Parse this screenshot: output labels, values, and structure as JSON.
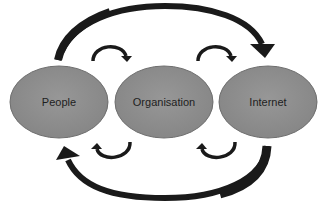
{
  "diagram": {
    "type": "cycle-flow",
    "nodes": [
      {
        "id": "people",
        "label": "People"
      },
      {
        "id": "organisation",
        "label": "Organisation"
      },
      {
        "id": "internet",
        "label": "Internet"
      }
    ],
    "edges": [
      {
        "from": "people",
        "to": "organisation",
        "style": "small-curved-arrow-top"
      },
      {
        "from": "organisation",
        "to": "internet",
        "style": "small-curved-arrow-top"
      },
      {
        "from": "internet",
        "to": "organisation",
        "style": "small-curved-arrow-bottom"
      },
      {
        "from": "organisation",
        "to": "people",
        "style": "small-curved-arrow-bottom"
      },
      {
        "from": "people",
        "to": "internet",
        "style": "large-curved-arrow-top"
      },
      {
        "from": "internet",
        "to": "people",
        "style": "large-curved-arrow-bottom"
      }
    ],
    "colors": {
      "node_fill": "#8c8c8c",
      "node_stroke": "#6e6e6e",
      "arrow": "#1a1a1a",
      "label": "#1e1e1e",
      "background": "#ffffff"
    }
  }
}
